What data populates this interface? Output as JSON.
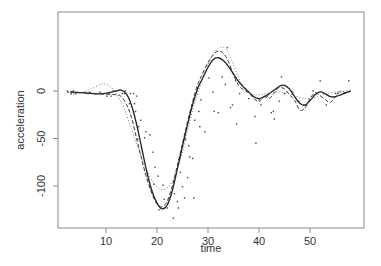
{
  "chart_data": {
    "type": "scatter",
    "title": "",
    "xlabel": "time",
    "ylabel": "acceleration",
    "xlim": [
      2,
      60
    ],
    "ylim": [
      -135,
      55
    ],
    "xticks": [
      10,
      20,
      30,
      40,
      50
    ],
    "yticks": [
      0,
      -50,
      -100
    ],
    "grid": false,
    "legend": null,
    "points": [
      [
        2.4,
        0
      ],
      [
        2.6,
        -1.3
      ],
      [
        3.2,
        -2.7
      ],
      [
        3.6,
        0
      ],
      [
        4.0,
        -2.7
      ],
      [
        6.2,
        -2.7
      ],
      [
        6.6,
        -2.7
      ],
      [
        6.8,
        -1.3
      ],
      [
        7.8,
        -2.7
      ],
      [
        8.2,
        -2.7
      ],
      [
        8.8,
        -1.3
      ],
      [
        9.6,
        -2.7
      ],
      [
        10.0,
        -2.7
      ],
      [
        10.2,
        -5.4
      ],
      [
        10.6,
        -2.7
      ],
      [
        11.0,
        -5.4
      ],
      [
        11.4,
        0
      ],
      [
        13.2,
        -2.7
      ],
      [
        13.6,
        -2.7
      ],
      [
        13.8,
        0
      ],
      [
        14.6,
        -13.3
      ],
      [
        14.8,
        -2.7
      ],
      [
        15.4,
        -22.8
      ],
      [
        15.4,
        -2.7
      ],
      [
        15.6,
        -13.3
      ],
      [
        15.8,
        -21.5
      ],
      [
        16.0,
        -5.4
      ],
      [
        16.2,
        -50.8
      ],
      [
        16.4,
        -37.5
      ],
      [
        16.8,
        -30.8
      ],
      [
        17.6,
        -49.2
      ],
      [
        17.8,
        -42.9
      ],
      [
        18.6,
        -46.2
      ],
      [
        19.2,
        -64.4
      ],
      [
        19.4,
        -98.1
      ],
      [
        19.6,
        -80.4
      ],
      [
        20.2,
        -89.6
      ],
      [
        20.4,
        -125
      ],
      [
        21.2,
        -99.1
      ],
      [
        21.4,
        -114
      ],
      [
        22.0,
        -123.1
      ],
      [
        22.6,
        -112
      ],
      [
        23.2,
        -133.9
      ],
      [
        23.4,
        -108
      ],
      [
        24.0,
        -116.3
      ],
      [
        24.2,
        -123.1
      ],
      [
        24.6,
        -85.6
      ],
      [
        25.0,
        -100.7
      ],
      [
        25.4,
        -112.5
      ],
      [
        25.6,
        -50.8
      ],
      [
        26.0,
        -91.1
      ],
      [
        26.2,
        -57.6
      ],
      [
        26.4,
        -69.6
      ],
      [
        27.0,
        -71
      ],
      [
        27.2,
        -112.5
      ],
      [
        27.4,
        -30.8
      ],
      [
        28.2,
        -21.5
      ],
      [
        28.4,
        -37.5
      ],
      [
        28.6,
        -9.3
      ],
      [
        29.4,
        -42.9
      ],
      [
        30.2,
        13.7
      ],
      [
        31.0,
        -1.3
      ],
      [
        31.2,
        -21.5
      ],
      [
        32.0,
        -22.8
      ],
      [
        32.8,
        14.7
      ],
      [
        33.4,
        6.8
      ],
      [
        33.8,
        45.6
      ],
      [
        34.4,
        -17.4
      ],
      [
        34.8,
        -14.7
      ],
      [
        35.2,
        14.7
      ],
      [
        35.4,
        10.7
      ],
      [
        35.6,
        -34.8
      ],
      [
        36.2,
        -2.7
      ],
      [
        38.0,
        -8.0
      ],
      [
        39.2,
        -26.8
      ],
      [
        39.4,
        -54.9
      ],
      [
        40.0,
        -9.3
      ],
      [
        40.4,
        -14.7
      ],
      [
        41.6,
        -5.4
      ],
      [
        42.4,
        -22.8
      ],
      [
        42.8,
        -21.5
      ],
      [
        43.0,
        -29.5
      ],
      [
        44.0,
        -10.7
      ],
      [
        44.4,
        14.7
      ],
      [
        45.0,
        -2.7
      ],
      [
        46.6,
        -1.3
      ],
      [
        47.8,
        -10.7
      ],
      [
        48.8,
        -14.7
      ],
      [
        50.6,
        0
      ],
      [
        52.0,
        10.7
      ],
      [
        53.2,
        -14.7
      ],
      [
        55.0,
        -2.7
      ],
      [
        55.4,
        -2.7
      ],
      [
        57.6,
        10.7
      ]
    ],
    "series": [
      {
        "name": "smooth-solid",
        "style": "solid",
        "x": [
          3,
          6,
          9,
          12,
          13,
          14,
          15,
          16,
          17,
          18,
          19,
          20,
          21,
          22,
          23,
          24,
          25,
          26,
          27,
          28,
          29,
          30,
          31,
          32,
          33,
          34,
          35,
          36,
          37,
          38,
          39,
          40,
          41,
          42,
          43,
          44,
          45,
          46,
          47,
          48,
          49,
          50,
          51,
          52,
          53,
          54,
          55,
          56,
          57,
          58
        ],
        "y": [
          -1,
          -2,
          -3,
          0,
          1,
          -3,
          -15,
          -35,
          -60,
          -85,
          -105,
          -118,
          -124,
          -120,
          -105,
          -82,
          -58,
          -35,
          -14,
          3,
          14,
          25,
          33,
          35,
          32,
          26,
          18,
          10,
          4,
          -1,
          -6,
          -8,
          -6,
          -3,
          1,
          5,
          6,
          2,
          -6,
          -13,
          -15,
          -10,
          -4,
          -1,
          -3,
          -6,
          -6,
          -4,
          -2,
          0
        ]
      },
      {
        "name": "smooth-dashed",
        "style": "dashed",
        "x": [
          3,
          6,
          9,
          12,
          13,
          14,
          15,
          16,
          17,
          18,
          19,
          20,
          21,
          22,
          23,
          24,
          25,
          26,
          27,
          28,
          29,
          30,
          31,
          32,
          33,
          34,
          35,
          36,
          37,
          38,
          39,
          40,
          41,
          42,
          43,
          44,
          45,
          46,
          47,
          48,
          49,
          50,
          51,
          52,
          53,
          54,
          55,
          56,
          57,
          58
        ],
        "y": [
          -1,
          -2,
          -3,
          -4,
          -6,
          -14,
          -28,
          -50,
          -72,
          -92,
          -108,
          -119,
          -122,
          -116,
          -100,
          -78,
          -55,
          -32,
          -11,
          7,
          19,
          30,
          38,
          42,
          40,
          31,
          17,
          6,
          1,
          -2,
          -8,
          -11,
          -6,
          -8,
          -2,
          4,
          2,
          -4,
          -10,
          -20,
          -18,
          -8,
          -2,
          -5,
          -9,
          -12,
          -6,
          0,
          -2,
          0
        ]
      },
      {
        "name": "smooth-dotted",
        "style": "dotted",
        "x": [
          3,
          5,
          7,
          9,
          10,
          11,
          12,
          13,
          14,
          15,
          16,
          17,
          18,
          19,
          20,
          21,
          22,
          23,
          24,
          25,
          26,
          27,
          28,
          29,
          30,
          31,
          32,
          33,
          34,
          35,
          36,
          37,
          38,
          39,
          40,
          41,
          42,
          43,
          44,
          45,
          46,
          47,
          48,
          49,
          50,
          51,
          52,
          53,
          54,
          55,
          56,
          57,
          58
        ],
        "y": [
          -4,
          -2,
          2,
          7,
          7,
          4,
          -3,
          -12,
          -25,
          -40,
          -56,
          -70,
          -83,
          -94,
          -101,
          -104,
          -102,
          -95,
          -82,
          -64,
          -42,
          -20,
          -2,
          14,
          28,
          38,
          45,
          46,
          40,
          27,
          14,
          4,
          -2,
          -4,
          -4,
          -3,
          -2,
          -1,
          -1,
          -2,
          -3,
          -5,
          -7,
          -8,
          -8,
          -7,
          -5,
          -3,
          -2,
          -1,
          -1,
          0,
          1
        ]
      }
    ]
  },
  "axes": {
    "xlabel": "time",
    "ylabel": "acceleration",
    "xtick_labels": [
      "10",
      "20",
      "30",
      "40",
      "50"
    ],
    "ytick_labels": [
      "0",
      "-50",
      "-100"
    ]
  },
  "colors": {
    "axis": "#8a8a8a",
    "text": "#333333",
    "line": "#222222",
    "dotted": "#666666",
    "points": "#444444"
  }
}
